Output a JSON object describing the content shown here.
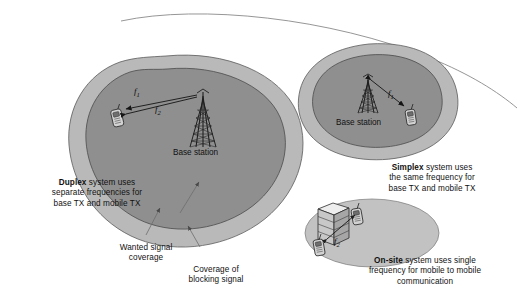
{
  "diagram": {
    "background_color": "#ffffff",
    "palette": {
      "outer_coverage_fill": "#b9b9b9",
      "inner_coverage_fill": "#8f8f8f",
      "onsite_fill": "#c2c2c2",
      "outline": "#4a4a4a",
      "text": "#111111",
      "tower": "#2b2b2b",
      "handset_body": "#cfcfcf",
      "building_fill": "#d2d2d2"
    }
  },
  "duplex": {
    "base_station_label": "Base station",
    "freq_near": "f",
    "freq_near_sub": "1",
    "freq_far": "f",
    "freq_far_sub": "2",
    "caption_bold": "Duplex",
    "caption_rest_line1": " system uses",
    "caption_line2": "separate frequencies for",
    "caption_line3": "base TX and mobile TX"
  },
  "simplex": {
    "base_station_label": "Base station",
    "freq": "f",
    "freq_sub": "1",
    "caption_bold": "Simplex",
    "caption_rest_line1": " system uses",
    "caption_line2": "the same frequency for",
    "caption_line3": "base TX and mobile TX"
  },
  "onsite": {
    "freq": "f",
    "freq_sub": "2",
    "caption_bold": "On-site",
    "caption_rest_line1": " system uses single",
    "caption_line2": "frequency for mobile to mobile",
    "caption_line3": "communication"
  },
  "annotations": {
    "wanted_line1": "Wanted signal",
    "wanted_line2": "coverage",
    "blocking_line1": "Coverage of",
    "blocking_line2": "blocking signal"
  },
  "icons": {
    "tower": "radio-mast-icon",
    "handset": "mobile-handset-icon",
    "building": "office-building-icon",
    "horizon": "horizon-arc"
  }
}
